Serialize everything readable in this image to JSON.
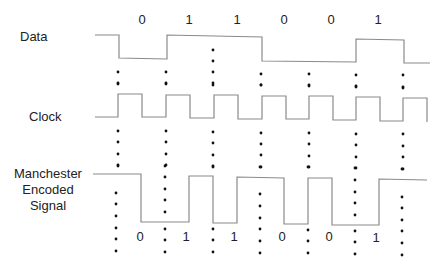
{
  "diagram": {
    "type": "timing-diagram",
    "rows": [
      {
        "id": "data",
        "label": "Data"
      },
      {
        "id": "clock",
        "label": "Clock"
      },
      {
        "id": "manchester",
        "label_lines": [
          "Manchester",
          "Encoded",
          "Signal"
        ]
      }
    ],
    "data_bits": [
      "0",
      "1",
      "1",
      "0",
      "0",
      "1"
    ],
    "encoded_bits": [
      "0",
      "1",
      "1",
      "0",
      "0",
      "1"
    ],
    "colors": {
      "line": "#8a8a8a",
      "dot": "#111111",
      "text": "#222222"
    }
  }
}
